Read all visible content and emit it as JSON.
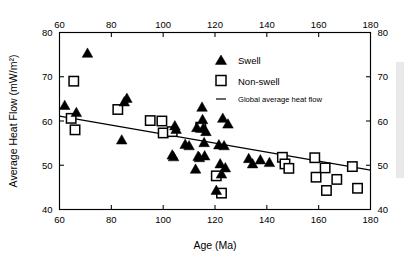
{
  "chart_data": {
    "type": "scatter",
    "title": "",
    "xlabel": "Age (Ma)",
    "ylabel": "Average Heat Flow (mW/m²)",
    "xlim": [
      60,
      180
    ],
    "ylim": [
      40,
      80
    ],
    "xticks": [
      60,
      80,
      100,
      120,
      140,
      160,
      180
    ],
    "yticks": [
      40,
      50,
      60,
      70,
      80
    ],
    "xtick_labels": [
      "60",
      "80",
      "100",
      "120",
      "140",
      "160",
      "180"
    ],
    "ytick_labels": [
      "40",
      "50",
      "60",
      "70",
      "80"
    ],
    "grid": false,
    "top_axis_mirrored": true,
    "right_axis_mirrored": true,
    "legend_position": "top-right-inside",
    "legend": [
      {
        "key": "swell",
        "label": "Swell",
        "marker": "filled-triangle",
        "color": "#000000"
      },
      {
        "key": "non_swell",
        "label": "Non-swell",
        "marker": "open-square",
        "color": "#000000"
      },
      {
        "key": "global_average",
        "label": "Global average heat flow",
        "marker": "line",
        "color": "#000000"
      }
    ],
    "series": [
      {
        "name": "Swell",
        "marker": "filled-triangle",
        "color": "#000000",
        "points": [
          [
            62.0,
            63.4
          ],
          [
            66.5,
            61.8
          ],
          [
            70.8,
            75.2
          ],
          [
            84.0,
            55.6
          ],
          [
            85.0,
            64.2
          ],
          [
            86.0,
            65.0
          ],
          [
            103.5,
            52.2
          ],
          [
            104.0,
            51.8
          ],
          [
            104.5,
            58.8
          ],
          [
            105.0,
            58.0
          ],
          [
            108.5,
            54.6
          ],
          [
            110.0,
            54.3
          ],
          [
            112.5,
            49.0
          ],
          [
            113.0,
            58.4
          ],
          [
            113.5,
            51.9
          ],
          [
            114.0,
            51.6
          ],
          [
            115.0,
            63.0
          ],
          [
            115.2,
            60.2
          ],
          [
            115.5,
            58.3
          ],
          [
            115.8,
            55.0
          ],
          [
            116.0,
            52.0
          ],
          [
            116.5,
            57.5
          ],
          [
            120.5,
            44.2
          ],
          [
            121.5,
            54.5
          ],
          [
            122.0,
            50.2
          ],
          [
            122.5,
            47.9
          ],
          [
            123.0,
            60.5
          ],
          [
            123.5,
            54.3
          ],
          [
            124.0,
            49.3
          ],
          [
            125.0,
            59.2
          ],
          [
            133.0,
            51.4
          ],
          [
            134.5,
            50.2
          ],
          [
            137.5,
            51.1
          ],
          [
            141.0,
            50.5
          ]
        ]
      },
      {
        "name": "Non-swell",
        "marker": "open-square",
        "color": "#000000",
        "points": [
          [
            64.5,
            60.6
          ],
          [
            65.5,
            69.0
          ],
          [
            66.0,
            58.0
          ],
          [
            82.5,
            62.6
          ],
          [
            95.0,
            60.1
          ],
          [
            99.5,
            60.0
          ],
          [
            100.0,
            57.3
          ],
          [
            103.5,
            57.6
          ],
          [
            114.5,
            58.6
          ],
          [
            120.5,
            47.6
          ],
          [
            122.5,
            43.7
          ],
          [
            146.0,
            51.8
          ],
          [
            147.0,
            50.3
          ],
          [
            148.5,
            49.3
          ],
          [
            158.5,
            51.7
          ],
          [
            159.0,
            47.3
          ],
          [
            162.5,
            49.4
          ],
          [
            163.0,
            44.3
          ],
          [
            167.0,
            46.8
          ],
          [
            173.0,
            49.7
          ],
          [
            175.0,
            44.8
          ]
        ]
      }
    ],
    "trend_line": {
      "name": "Global average heat flow",
      "color": "#000000",
      "x": [
        60,
        180
      ],
      "y": [
        61.1,
        48.9
      ]
    }
  },
  "figure": {
    "background_color": "#ffffff",
    "axis_color": "#000000"
  }
}
